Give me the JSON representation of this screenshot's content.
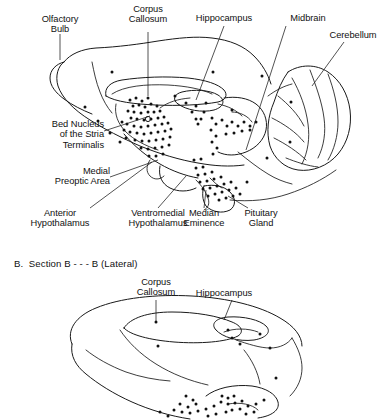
{
  "figure": {
    "background_color": "#ffffff",
    "ink_color": "#111111",
    "panels": [
      {
        "id": "panel-a",
        "caption": "",
        "view": "Sagittal (Medial)",
        "labels": [
          {
            "name": "olfactory-bulb",
            "text": "Olfactory\nBulb"
          },
          {
            "name": "corpus-callosum",
            "text": "Corpus\nCallosum"
          },
          {
            "name": "hippocampus",
            "text": "Hippocampus"
          },
          {
            "name": "midbrain",
            "text": "Midbrain"
          },
          {
            "name": "cerebellum",
            "text": "Cerebellum"
          },
          {
            "name": "bed-nucleus-stria-terminalis",
            "text": "Bed Nucleus\nof the Stria\nTerminalis"
          },
          {
            "name": "medial-preoptic-area",
            "text": "Medial\nPreoptic Area"
          },
          {
            "name": "anterior-hypothalamus",
            "text": "Anterior\nHypothalamus"
          },
          {
            "name": "ventromedial-hypothalamus",
            "text": "Ventromedial\nHypothalamus"
          },
          {
            "name": "median-eminence",
            "text": "Median\nEminence"
          },
          {
            "name": "pituitary-gland",
            "text": "Pituitary\nGland"
          }
        ]
      },
      {
        "id": "panel-b",
        "caption": "B.  Section B - - - B (Lateral)",
        "view": "Lateral",
        "labels": [
          {
            "name": "corpus-callosum",
            "text": "Corpus\nCallosum"
          },
          {
            "name": "hippocampus",
            "text": "Hippocampus"
          }
        ]
      }
    ]
  }
}
